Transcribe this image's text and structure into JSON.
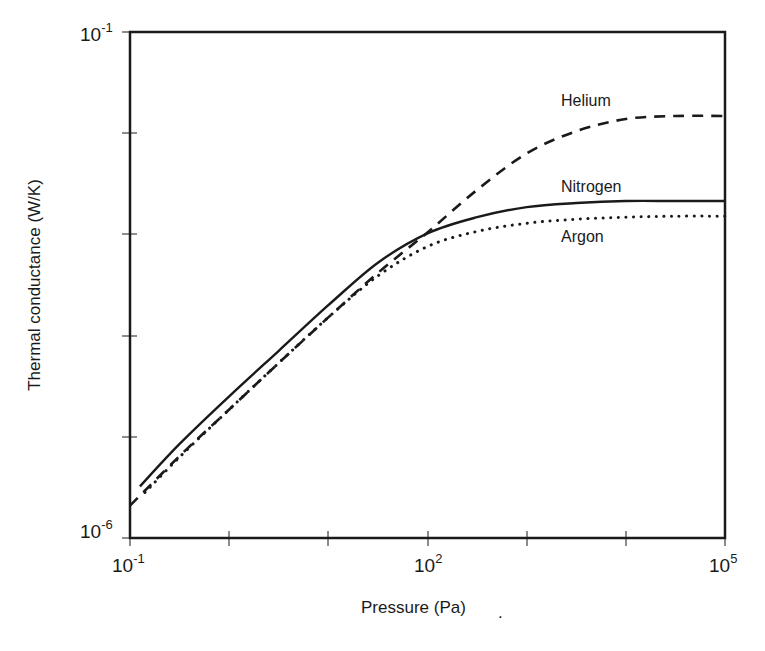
{
  "chart_data": {
    "type": "line",
    "title": "",
    "xlabel": "Pressure (Pa)",
    "ylabel": "Thermal conductance (W/K)",
    "xscale": "log",
    "yscale": "log",
    "xlim": [
      0.1,
      100000
    ],
    "ylim": [
      1e-06,
      0.1
    ],
    "grid": false,
    "legend": "inline labels at right",
    "x_ticks": [
      {
        "base": "10",
        "exp": "-1",
        "labeled": true
      },
      {
        "base": "",
        "exp": "",
        "labeled": false
      },
      {
        "base": "",
        "exp": "",
        "labeled": false
      },
      {
        "base": "10",
        "exp": "2",
        "labeled": true
      },
      {
        "base": "",
        "exp": "",
        "labeled": false
      },
      {
        "base": "",
        "exp": "",
        "labeled": false
      },
      {
        "base": "10",
        "exp": "5",
        "labeled": true
      }
    ],
    "y_ticks": [
      {
        "base": "10",
        "exp": "-1",
        "labeled": true
      },
      {
        "base": "",
        "exp": "",
        "labeled": false
      },
      {
        "base": "",
        "exp": "",
        "labeled": false
      },
      {
        "base": "",
        "exp": "",
        "labeled": false
      },
      {
        "base": "",
        "exp": "",
        "labeled": false
      },
      {
        "base": "10",
        "exp": "-6",
        "labeled": true
      }
    ],
    "series": [
      {
        "name": "Helium",
        "style": "dashed",
        "log10_x": [
          -1.0,
          -0.5,
          0.0,
          0.5,
          1.0,
          1.5,
          2.0,
          2.5,
          3.0,
          3.5,
          4.0,
          4.5,
          5.0
        ],
        "log10_y": [
          -5.68,
          -5.19,
          -4.73,
          -4.27,
          -3.82,
          -3.38,
          -2.98,
          -2.56,
          -2.2,
          -1.98,
          -1.86,
          -1.83,
          -1.83
        ]
      },
      {
        "name": "Nitrogen",
        "style": "solid",
        "log10_x": [
          -0.9,
          -0.5,
          0.0,
          0.5,
          1.0,
          1.5,
          2.0,
          2.5,
          3.0,
          3.5,
          4.0,
          4.5,
          5.0
        ],
        "log10_y": [
          -5.49,
          -5.07,
          -4.6,
          -4.15,
          -3.7,
          -3.28,
          -2.99,
          -2.83,
          -2.73,
          -2.69,
          -2.67,
          -2.67,
          -2.67
        ]
      },
      {
        "name": "Argon",
        "style": "dotted",
        "log10_x": [
          -0.85,
          -0.5,
          0.0,
          0.5,
          1.0,
          1.5,
          2.0,
          2.5,
          3.0,
          3.5,
          4.0,
          4.5,
          5.0
        ],
        "log10_y": [
          -5.55,
          -5.2,
          -4.73,
          -4.27,
          -3.82,
          -3.41,
          -3.12,
          -2.97,
          -2.89,
          -2.85,
          -2.83,
          -2.82,
          -2.82
        ]
      }
    ],
    "series_labels": [
      {
        "name": "Helium",
        "anchor_log10_x": 3.3,
        "anchor_log10_y": -1.67
      },
      {
        "name": "Nitrogen",
        "anchor_log10_x": 3.3,
        "anchor_log10_y": -2.52
      },
      {
        "name": "Argon",
        "anchor_log10_x": 3.3,
        "anchor_log10_y": -3.02
      }
    ]
  },
  "labels": {
    "x_axis_title": "Pressure (Pa)",
    "y_axis_title": "Thermal conductance (W/K)",
    "helium": "Helium",
    "nitrogen": "Nitrogen",
    "argon": "Argon",
    "x_tick_min_base": "10",
    "x_tick_min_exp": "-1",
    "x_tick_mid_base": "10",
    "x_tick_mid_exp": "2",
    "x_tick_max_base": "10",
    "x_tick_max_exp": "5",
    "y_tick_max_base": "10",
    "y_tick_max_exp": "-1",
    "y_tick_min_base": "10",
    "y_tick_min_exp": "-6",
    "trailing_mark": "."
  },
  "colors": {
    "ink": "#1a1a1a",
    "background": "#ffffff"
  }
}
